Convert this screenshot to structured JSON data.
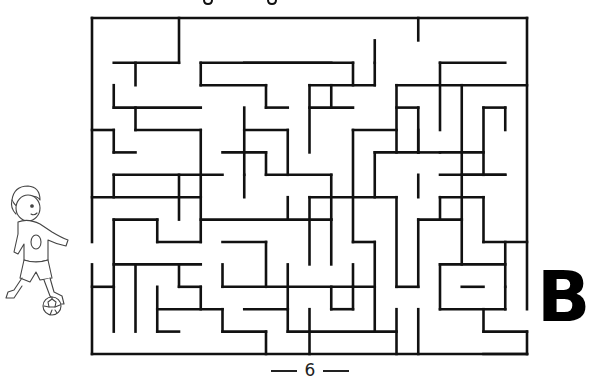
{
  "puzzle": {
    "type": "maze",
    "grid": {
      "cols": 20,
      "rows": 15,
      "origin_x": 92,
      "origin_y": 18,
      "cell_w": 21.75,
      "cell_h": 22.4
    },
    "start": {
      "side": "left",
      "row": 10,
      "figure": "child-playing-soccer"
    },
    "exit": {
      "side": "right",
      "row": 13,
      "label": "B"
    },
    "wall_color": "#111111",
    "walls": [
      [
        0,
        0,
        20,
        0
      ],
      [
        0,
        0,
        0,
        10
      ],
      [
        0,
        11,
        0,
        15
      ],
      [
        0,
        15,
        20,
        15
      ],
      [
        20,
        0,
        20,
        13
      ],
      [
        20,
        14,
        20,
        15
      ],
      [
        4,
        0,
        4,
        2
      ],
      [
        15,
        0,
        15,
        1
      ],
      [
        1,
        2,
        4,
        2
      ],
      [
        2,
        2,
        2,
        3
      ],
      [
        5,
        3,
        5,
        2
      ],
      [
        5,
        2,
        11,
        2
      ],
      [
        7,
        2,
        12,
        2
      ],
      [
        12,
        2,
        12,
        3
      ],
      [
        13,
        1,
        13,
        2
      ],
      [
        16,
        2,
        16,
        5
      ],
      [
        16,
        2,
        19,
        2
      ],
      [
        13,
        2,
        13,
        3
      ],
      [
        1,
        3,
        1,
        4
      ],
      [
        1,
        4,
        5,
        4
      ],
      [
        5,
        3,
        8,
        3
      ],
      [
        8,
        3,
        8,
        4
      ],
      [
        8,
        4,
        9,
        4
      ],
      [
        10,
        3,
        13,
        3
      ],
      [
        10,
        3,
        10,
        6
      ],
      [
        10,
        4,
        12,
        4
      ],
      [
        11,
        3,
        11,
        4
      ],
      [
        14,
        3,
        14,
        6
      ],
      [
        14,
        3,
        20,
        3
      ],
      [
        17,
        3,
        17,
        9
      ],
      [
        19,
        4,
        19,
        5
      ],
      [
        18,
        4,
        19,
        4
      ],
      [
        0,
        5,
        1,
        5
      ],
      [
        1,
        5,
        1,
        6
      ],
      [
        1,
        6,
        2,
        6
      ],
      [
        2,
        4,
        2,
        5
      ],
      [
        2,
        5,
        5,
        5
      ],
      [
        5,
        5,
        5,
        10
      ],
      [
        7,
        4,
        7,
        7
      ],
      [
        7,
        5,
        9,
        5
      ],
      [
        9,
        5,
        9,
        7
      ],
      [
        12,
        5,
        12,
        10
      ],
      [
        11,
        5,
        11,
        5
      ],
      [
        12,
        5,
        14,
        5
      ],
      [
        15,
        4,
        15,
        6
      ],
      [
        15,
        6,
        16,
        6
      ],
      [
        14,
        4,
        15,
        4
      ],
      [
        1,
        7,
        1,
        8
      ],
      [
        1,
        7,
        6,
        7
      ],
      [
        6,
        6,
        8,
        6
      ],
      [
        8,
        6,
        8,
        7
      ],
      [
        8,
        7,
        11,
        7
      ],
      [
        11,
        7,
        11,
        9
      ],
      [
        13,
        6,
        13,
        8
      ],
      [
        13,
        6,
        15,
        6
      ],
      [
        15,
        6,
        15,
        5
      ],
      [
        16,
        6,
        18,
        6
      ],
      [
        18,
        4,
        18,
        7
      ],
      [
        17,
        7,
        19,
        7
      ],
      [
        16,
        7,
        19,
        7
      ],
      [
        0,
        8,
        5,
        8
      ],
      [
        4,
        7,
        4,
        9
      ],
      [
        7,
        7,
        7,
        8
      ],
      [
        9,
        8,
        9,
        9
      ],
      [
        10,
        8,
        10,
        11
      ],
      [
        10,
        8,
        14,
        8
      ],
      [
        14,
        8,
        14,
        12
      ],
      [
        15,
        7,
        15,
        8
      ],
      [
        16,
        8,
        18,
        8
      ],
      [
        16,
        8,
        16,
        9
      ],
      [
        18,
        8,
        18,
        10
      ],
      [
        18,
        10,
        20,
        10
      ],
      [
        1,
        9,
        3,
        9
      ],
      [
        1,
        9,
        1,
        12
      ],
      [
        3,
        9,
        3,
        10
      ],
      [
        3,
        10,
        5,
        10
      ],
      [
        5,
        9,
        11,
        9
      ],
      [
        11,
        9,
        11,
        11
      ],
      [
        8,
        10,
        8,
        12
      ],
      [
        6,
        10,
        8,
        10
      ],
      [
        12,
        10,
        13,
        10
      ],
      [
        15,
        9,
        15,
        12
      ],
      [
        15,
        9,
        17,
        9
      ],
      [
        17,
        9,
        17,
        11
      ],
      [
        19,
        10,
        19,
        12
      ],
      [
        1,
        11,
        5,
        11
      ],
      [
        2,
        11,
        2,
        14
      ],
      [
        4,
        11,
        4,
        12
      ],
      [
        4,
        12,
        5,
        12
      ],
      [
        5,
        12,
        5,
        13
      ],
      [
        6,
        11,
        6,
        12
      ],
      [
        6,
        12,
        13,
        12
      ],
      [
        9,
        11,
        9,
        13
      ],
      [
        13,
        10,
        13,
        14
      ],
      [
        12,
        11,
        12,
        12
      ],
      [
        14,
        12,
        15,
        12
      ],
      [
        16,
        11,
        19,
        11
      ],
      [
        16,
        11,
        16,
        13
      ],
      [
        16,
        13,
        19,
        13
      ],
      [
        19,
        12,
        19,
        13
      ],
      [
        17,
        12,
        17,
        12
      ],
      [
        17,
        12,
        18,
        12
      ],
      [
        0,
        12,
        1,
        12
      ],
      [
        1,
        12,
        1,
        14
      ],
      [
        3,
        12,
        3,
        14
      ],
      [
        3,
        13,
        6,
        13
      ],
      [
        3,
        14,
        4,
        14
      ],
      [
        6,
        13,
        6,
        14
      ],
      [
        6,
        14,
        8,
        14
      ],
      [
        7,
        13,
        9,
        13
      ],
      [
        9,
        13,
        9,
        14
      ],
      [
        9,
        14,
        14,
        14
      ],
      [
        10,
        13,
        10,
        15
      ],
      [
        11,
        13,
        12,
        13
      ],
      [
        12,
        12,
        12,
        13
      ],
      [
        14,
        13,
        14,
        15
      ],
      [
        15,
        13,
        15,
        15
      ],
      [
        18,
        14,
        20,
        14
      ],
      [
        18,
        13,
        18,
        14
      ],
      [
        17,
        14,
        17,
        14
      ],
      [
        8,
        14,
        8,
        15
      ],
      [
        11,
        12,
        11,
        13
      ],
      [
        18,
        15,
        20,
        15
      ]
    ]
  },
  "page": {
    "number": "6",
    "title_fragment": "g g"
  }
}
